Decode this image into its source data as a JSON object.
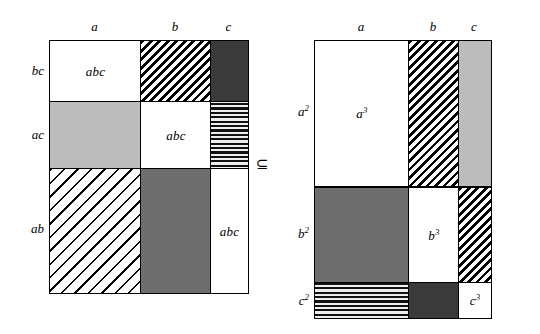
{
  "diagram": {
    "relation_symbol": "⊆",
    "left_figure": {
      "name": "left-matrix",
      "column_headers": [
        {
          "text": "a",
          "sup": ""
        },
        {
          "text": "b",
          "sup": ""
        },
        {
          "text": "c",
          "sup": ""
        }
      ],
      "row_headers": [
        {
          "text": "bc",
          "sup": ""
        },
        {
          "text": "ac",
          "sup": ""
        },
        {
          "text": "ab",
          "sup": ""
        }
      ],
      "cells": [
        {
          "row": "bc",
          "col": "a",
          "label": "abc",
          "sup": "",
          "fill": "white"
        },
        {
          "row": "bc",
          "col": "b",
          "label": "",
          "sup": "",
          "fill": "hatch-dense"
        },
        {
          "row": "bc",
          "col": "c",
          "label": "",
          "sup": "",
          "fill": "darkgray"
        },
        {
          "row": "ac",
          "col": "a",
          "label": "",
          "sup": "",
          "fill": "lightgray"
        },
        {
          "row": "ac",
          "col": "b",
          "label": "abc",
          "sup": "",
          "fill": "white"
        },
        {
          "row": "ac",
          "col": "c",
          "label": "",
          "sup": "",
          "fill": "checker"
        },
        {
          "row": "ab",
          "col": "a",
          "label": "",
          "sup": "",
          "fill": "hatch-sparse"
        },
        {
          "row": "ab",
          "col": "b",
          "label": "",
          "sup": "",
          "fill": "midgray"
        },
        {
          "row": "ab",
          "col": "c",
          "label": "abc",
          "sup": "",
          "fill": "white"
        }
      ]
    },
    "right_figure": {
      "name": "right-matrix",
      "column_headers": [
        {
          "text": "a",
          "sup": ""
        },
        {
          "text": "b",
          "sup": ""
        },
        {
          "text": "c",
          "sup": ""
        }
      ],
      "row_headers": [
        {
          "text": "a",
          "sup": "2"
        },
        {
          "text": "b",
          "sup": "2"
        },
        {
          "text": "c",
          "sup": "2"
        }
      ],
      "cells": [
        {
          "row": "a2",
          "col": "a",
          "label": "a",
          "sup": "3",
          "fill": "white"
        },
        {
          "row": "a2",
          "col": "b",
          "label": "",
          "sup": "",
          "fill": "hatch-dense"
        },
        {
          "row": "a2",
          "col": "c",
          "label": "",
          "sup": "",
          "fill": "lightgray"
        },
        {
          "row": "b2",
          "col": "a",
          "label": "",
          "sup": "",
          "fill": "midgray"
        },
        {
          "row": "b2",
          "col": "b",
          "label": "b",
          "sup": "3",
          "fill": "white"
        },
        {
          "row": "b2",
          "col": "c",
          "label": "",
          "sup": "",
          "fill": "hatch-dense"
        },
        {
          "row": "c2",
          "col": "a",
          "label": "",
          "sup": "",
          "fill": "checker"
        },
        {
          "row": "c2",
          "col": "b",
          "label": "",
          "sup": "",
          "fill": "darkgray"
        },
        {
          "row": "c2",
          "col": "c",
          "label": "c",
          "sup": "3",
          "fill": "white"
        }
      ]
    },
    "colors": {
      "white": "#ffffff",
      "light_gray": "#bcbcbc",
      "mid_gray": "#6e6e6e",
      "dark_gray": "#3a3a3a",
      "stroke": "#000000"
    }
  }
}
